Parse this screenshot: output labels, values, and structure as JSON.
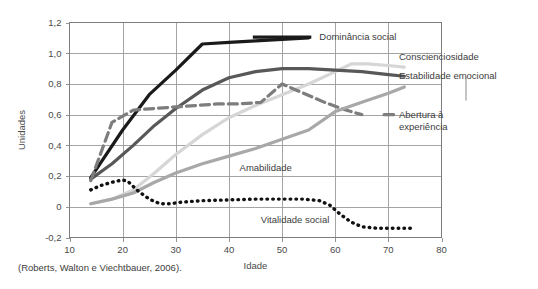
{
  "caption": "(Roberts, Walton e Viechtbauer, 2006).",
  "chart_data": {
    "type": "line",
    "title": "",
    "xlabel": "Idade",
    "ylabel": "Unidades",
    "xlim": [
      10,
      80
    ],
    "ylim": [
      -0.2,
      1.2
    ],
    "xticks": [
      "10",
      "20",
      "30",
      "40",
      "50",
      "60",
      "70",
      "80"
    ],
    "xtick_values": [
      10,
      20,
      30,
      40,
      50,
      60,
      70,
      80
    ],
    "yticks": [
      "-0,2",
      "0",
      "0,2",
      "0,4",
      "0,6",
      "0,8",
      "1,0",
      "1,2"
    ],
    "ytick_values": [
      -0.2,
      0,
      0.2,
      0.4,
      0.6,
      0.8,
      1.0,
      1.2
    ],
    "grid": true,
    "legend_position": "inline-annotations",
    "series": [
      {
        "name": "Dominância social",
        "style": "solid",
        "color": "#1a1a1a",
        "width": 3.2,
        "label_x": 57,
        "label_y": 1.105,
        "x": [
          14,
          20,
          25,
          30,
          35,
          40,
          45,
          50,
          55
        ],
        "y": [
          0.19,
          0.5,
          0.73,
          0.89,
          1.06,
          1.07,
          1.08,
          1.09,
          1.1
        ]
      },
      {
        "name": "Conscienciosidade",
        "style": "solid",
        "color": "#d6d6d6",
        "width": 3.2,
        "label_x": 72,
        "label_y": 0.975,
        "x": [
          14,
          18,
          22,
          26,
          30,
          35,
          40,
          45,
          50,
          55,
          60,
          63,
          66,
          70,
          73
        ],
        "y": [
          0.02,
          0.05,
          0.11,
          0.22,
          0.34,
          0.47,
          0.58,
          0.66,
          0.73,
          0.8,
          0.88,
          0.93,
          0.93,
          0.92,
          0.91
        ]
      },
      {
        "name": "Estabilidade emocional",
        "style": "solid",
        "color": "#585858",
        "width": 3.2,
        "label_x": 72,
        "label_y": 0.855,
        "x": [
          14,
          18,
          22,
          26,
          30,
          35,
          40,
          45,
          50,
          55,
          60,
          65,
          70,
          73
        ],
        "y": [
          0.18,
          0.28,
          0.4,
          0.53,
          0.64,
          0.76,
          0.84,
          0.88,
          0.9,
          0.9,
          0.89,
          0.88,
          0.86,
          0.85
        ]
      },
      {
        "name": "Abertura à experiência",
        "style": "dashed",
        "color": "#7d7d7d",
        "width": 3.2,
        "label_x": 72,
        "label_y": 0.6,
        "label_line2": "experiência",
        "x": [
          14,
          18,
          22,
          26,
          30,
          34,
          38,
          42,
          46,
          50,
          54,
          58,
          62,
          65
        ],
        "y": [
          0.17,
          0.55,
          0.63,
          0.64,
          0.65,
          0.66,
          0.67,
          0.67,
          0.68,
          0.8,
          0.74,
          0.68,
          0.63,
          0.6
        ]
      },
      {
        "name": "Amabilidade",
        "style": "solid",
        "color": "#a8a8a8",
        "width": 3.2,
        "label_x": 42,
        "label_y": 0.255,
        "x": [
          14,
          18,
          22,
          26,
          30,
          35,
          40,
          45,
          50,
          55,
          60,
          65,
          70,
          73
        ],
        "y": [
          0.02,
          0.05,
          0.09,
          0.16,
          0.22,
          0.28,
          0.33,
          0.38,
          0.44,
          0.5,
          0.62,
          0.68,
          0.74,
          0.78
        ]
      },
      {
        "name": "Vitalidade social",
        "style": "dotted",
        "color": "#111111",
        "width": 3.4,
        "label_x": 46,
        "label_y": -0.085,
        "x": [
          14,
          16,
          18,
          20,
          21,
          23,
          25,
          27,
          29,
          31,
          35,
          40,
          45,
          50,
          54,
          57,
          59,
          61,
          63,
          65,
          68,
          71,
          75
        ],
        "y": [
          0.11,
          0.14,
          0.16,
          0.175,
          0.165,
          0.1,
          0.05,
          0.02,
          0.02,
          0.03,
          0.04,
          0.045,
          0.05,
          0.05,
          0.05,
          0.04,
          0.01,
          -0.05,
          -0.1,
          -0.13,
          -0.14,
          -0.14,
          -0.14
        ]
      }
    ]
  }
}
